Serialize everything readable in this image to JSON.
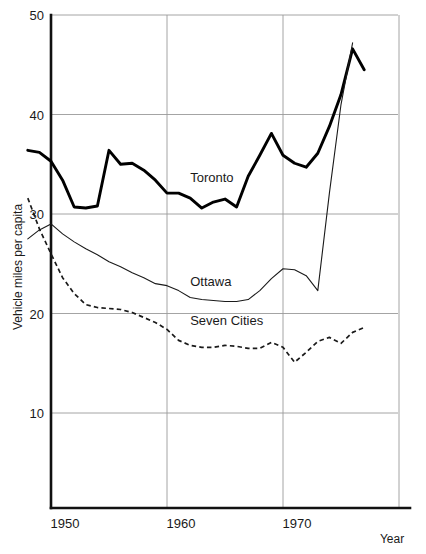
{
  "chart_data": {
    "type": "line",
    "title": "",
    "xlabel": "Year",
    "ylabel": "Vehicle miles per capita",
    "xlim": [
      1948,
      1980
    ],
    "ylim": [
      0,
      50
    ],
    "xticks": [
      1950,
      1960,
      1970
    ],
    "xtick_labels": [
      "1950",
      "1960",
      "1970"
    ],
    "yticks": [
      10,
      20,
      30,
      40,
      50
    ],
    "ytick_labels": [
      "10",
      "20",
      "30",
      "40",
      "50"
    ],
    "grid": true,
    "legend_position": "inline-annotations",
    "series": [
      {
        "name": "Toronto",
        "style": "thick-solid",
        "label_year": 1962,
        "label_value": 33.2,
        "x": [
          1948,
          1949,
          1950,
          1951,
          1952,
          1953,
          1954,
          1955,
          1956,
          1957,
          1958,
          1959,
          1960,
          1961,
          1962,
          1963,
          1964,
          1965,
          1966,
          1967,
          1968,
          1969,
          1970,
          1971,
          1972,
          1973,
          1974,
          1975,
          1976,
          1977
        ],
        "y": [
          36.4,
          36.2,
          35.3,
          33.4,
          30.7,
          30.6,
          30.8,
          36.4,
          35.0,
          35.1,
          34.4,
          33.4,
          32.1,
          32.1,
          31.6,
          30.6,
          31.2,
          31.5,
          30.7,
          33.8,
          35.9,
          38.1,
          35.9,
          35.1,
          34.7,
          36.1,
          38.8,
          42.0,
          46.6,
          44.5
        ]
      },
      {
        "name": "Ottawa",
        "style": "thin-solid",
        "label_year": 1962,
        "label_value": 22.8,
        "x": [
          1948,
          1949,
          1950,
          1951,
          1952,
          1953,
          1954,
          1955,
          1956,
          1957,
          1958,
          1959,
          1960,
          1961,
          1962,
          1963,
          1964,
          1965,
          1966,
          1967,
          1968,
          1969,
          1970,
          1971,
          1972,
          1973,
          1974,
          1975,
          1976
        ],
        "y": [
          27.5,
          28.4,
          29.0,
          28.0,
          27.2,
          26.5,
          25.9,
          25.2,
          24.7,
          24.1,
          23.6,
          23.0,
          22.8,
          22.3,
          21.6,
          21.4,
          21.3,
          21.2,
          21.2,
          21.4,
          22.3,
          23.5,
          24.5,
          24.4,
          23.8,
          22.3,
          32.1,
          41.0,
          47.2
        ]
      },
      {
        "name": "Seven Cities",
        "style": "dashed",
        "label_year": 1962,
        "label_value": 18.8,
        "x": [
          1948,
          1949,
          1950,
          1951,
          1952,
          1953,
          1954,
          1955,
          1956,
          1957,
          1958,
          1959,
          1960,
          1961,
          1962,
          1963,
          1964,
          1965,
          1966,
          1967,
          1968,
          1969,
          1970,
          1971,
          1972,
          1973,
          1974,
          1975,
          1976,
          1977
        ],
        "y": [
          31.6,
          28.5,
          26.0,
          23.6,
          22.0,
          20.9,
          20.6,
          20.5,
          20.4,
          20.1,
          19.6,
          19.1,
          18.4,
          17.3,
          16.8,
          16.6,
          16.6,
          16.8,
          16.7,
          16.5,
          16.5,
          17.1,
          16.6,
          15.1,
          16.1,
          17.2,
          17.6,
          17.0,
          18.1,
          18.6
        ]
      }
    ]
  }
}
